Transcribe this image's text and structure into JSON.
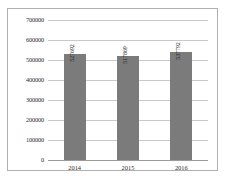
{
  "chart_data": {
    "type": "bar",
    "title": "",
    "subtitle": "",
    "xlabel": "",
    "ylabel": "",
    "categories": [
      "2014",
      "2015",
      "2016"
    ],
    "values": [
      527692,
      517869,
      537792
    ],
    "data_labels": [
      "527692",
      "517869",
      "537792"
    ],
    "data_label_rotation": "vertical",
    "ylim": [
      0,
      700000
    ],
    "ytick_labels": [
      "700000",
      "600000",
      "500000",
      "400000",
      "300000",
      "200000",
      "100000",
      "0"
    ],
    "ytick_values": [
      700000,
      600000,
      500000,
      400000,
      300000,
      200000,
      100000,
      0
    ],
    "ytick_step": 100000,
    "grid": "horizontal",
    "legend": "none",
    "series": [
      {
        "name": "",
        "values": [
          527692,
          517869,
          537792
        ],
        "color": "#7b7b7b"
      }
    ],
    "colors": {
      "bar": "#7b7b7b",
      "gridline": "#c9c9c9",
      "axis": "#9a9a9a",
      "border": "#b0b0b0",
      "text": "#2b2b2b",
      "background": "#ffffff"
    }
  }
}
